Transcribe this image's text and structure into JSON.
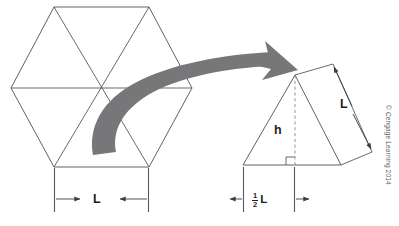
{
  "figure": {
    "background_color": "#ffffff",
    "line_color": "#58585a",
    "arrow_fill": "#77777a",
    "text_color": "#1d1d1d"
  },
  "left_shape": {
    "name": "regular-hexagon",
    "description": "Regular hexagon with three long diagonals forming six equilateral triangles",
    "vertices": [
      {
        "x": 11,
        "y": 88
      },
      {
        "x": 54,
        "y": 7
      },
      {
        "x": 149,
        "y": 7
      },
      {
        "x": 192,
        "y": 88
      },
      {
        "x": 149,
        "y": 167
      },
      {
        "x": 54,
        "y": 167
      }
    ],
    "center": {
      "x": 101.5,
      "y": 88
    },
    "diagonals": [
      [
        0,
        3
      ],
      [
        1,
        4
      ],
      [
        2,
        5
      ]
    ],
    "triangle_count": 6
  },
  "left_dimension": {
    "name": "hexagon-side-dimension",
    "label": "L",
    "from_x": 54,
    "to_x": 149,
    "baseline_y": 196,
    "extension_top_y": 168,
    "extension_bottom_y": 212,
    "arrow_direction": "inward"
  },
  "transfer_arrow": {
    "name": "curved-transfer-arrow",
    "description": "Thick curved gray arrow from hexagon center to the extracted triangle",
    "tail": {
      "x": 93,
      "y": 155
    },
    "head": {
      "x": 296,
      "y": 72
    },
    "fill": "#77777a"
  },
  "right_shape": {
    "name": "equilateral-triangle",
    "description": "One of the six equilateral triangles, shown enlarged with altitude h",
    "apex": {
      "x": 295,
      "y": 75
    },
    "base_left": {
      "x": 243,
      "y": 165
    },
    "base_right": {
      "x": 341,
      "y": 165
    },
    "altitude": {
      "label": "h",
      "style": "dashed",
      "foot": {
        "x": 295,
        "y": 165
      },
      "right_angle_marker": true
    }
  },
  "side_dimension": {
    "name": "triangle-side-dimension",
    "label": "L",
    "description": "Tilted dimension quadrilateral measuring the slanted side length L",
    "quad_vertices": [
      {
        "x": 295,
        "y": 75
      },
      {
        "x": 333,
        "y": 64
      },
      {
        "x": 372,
        "y": 152
      },
      {
        "x": 341,
        "y": 165
      }
    ],
    "arrow_from": {
      "x": 340,
      "y": 72
    },
    "arrow_to": {
      "x": 372,
      "y": 147
    },
    "arrow_direction": "outward-both-ends"
  },
  "base_dimension": {
    "name": "half-base-dimension",
    "label_numerator": "1",
    "label_denominator": "2",
    "label_unit": "L",
    "label_text": "½ L",
    "from_x": 243,
    "to_x": 295,
    "baseline_y": 196,
    "extension_top_y": 166,
    "extension_bottom_y": 212,
    "arrow_direction": "outward"
  },
  "credit": {
    "name": "copyright-notice",
    "text": "© Cengage Learning 2014",
    "orientation": "vertical-rotated-90"
  }
}
